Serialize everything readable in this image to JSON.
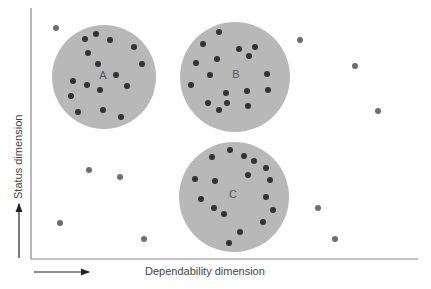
{
  "figure": {
    "x_axis_label": "Dependability dimension",
    "y_axis_label": "Status dimension",
    "colors": {
      "cluster_fill": "#b8b8b8",
      "member_dot": "#333333",
      "outlier_dot": "#6e6e6e",
      "axis": "#888888"
    },
    "clusters": [
      {
        "label": "A",
        "cx": 104,
        "cy": 77,
        "r": 52,
        "label_pos": [
          103,
          79
        ],
        "points": [
          [
            85,
            39
          ],
          [
            96,
            34
          ],
          [
            110,
            40
          ],
          [
            134,
            47
          ],
          [
            88,
            53
          ],
          [
            142,
            64
          ],
          [
            98,
            64
          ],
          [
            116,
            75
          ],
          [
            73,
            81
          ],
          [
            87,
            85
          ],
          [
            100,
            90
          ],
          [
            127,
            86
          ],
          [
            71,
            96
          ],
          [
            78,
            112
          ],
          [
            103,
            110
          ],
          [
            121,
            117
          ]
        ]
      },
      {
        "label": "B",
        "cx": 235,
        "cy": 77,
        "r": 55,
        "label_pos": [
          236,
          78
        ],
        "points": [
          [
            219,
            32
          ],
          [
            203,
            44
          ],
          [
            239,
            49
          ],
          [
            255,
            47
          ],
          [
            249,
            56
          ],
          [
            217,
            59
          ],
          [
            196,
            63
          ],
          [
            210,
            75
          ],
          [
            267,
            74
          ],
          [
            191,
            85
          ],
          [
            226,
            93
          ],
          [
            247,
            91
          ],
          [
            268,
            90
          ],
          [
            208,
            103
          ],
          [
            227,
            103
          ],
          [
            248,
            106
          ],
          [
            219,
            110
          ]
        ]
      },
      {
        "label": "C",
        "cx": 234,
        "cy": 197,
        "r": 55,
        "label_pos": [
          233,
          198
        ],
        "points": [
          [
            230,
            150
          ],
          [
            212,
            157
          ],
          [
            244,
            156
          ],
          [
            254,
            161
          ],
          [
            266,
            168
          ],
          [
            195,
            179
          ],
          [
            215,
            181
          ],
          [
            248,
            175
          ],
          [
            270,
            180
          ],
          [
            201,
            199
          ],
          [
            266,
            197
          ],
          [
            214,
            208
          ],
          [
            224,
            214
          ],
          [
            273,
            210
          ],
          [
            263,
            222
          ],
          [
            240,
            232
          ],
          [
            229,
            243
          ]
        ]
      }
    ],
    "outliers": [
      [
        56,
        28
      ],
      [
        300,
        40
      ],
      [
        355,
        66
      ],
      [
        378,
        111
      ],
      [
        89,
        170
      ],
      [
        120,
        177
      ],
      [
        60,
        223
      ],
      [
        144,
        239
      ],
      [
        318,
        208
      ],
      [
        335,
        239
      ]
    ]
  }
}
